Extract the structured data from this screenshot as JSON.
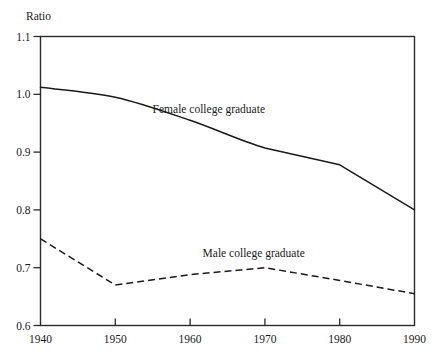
{
  "chart_data": {
    "type": "line",
    "title": "",
    "subtitle": "",
    "xlabel": "",
    "ylabel": "Ratio",
    "ylabel_position": "above-top-left",
    "x": [
      1940,
      1950,
      1960,
      1970,
      1980,
      1990
    ],
    "xlim": [
      1940,
      1990
    ],
    "ylim": [
      0.6,
      1.1
    ],
    "xticks": [
      1940,
      1950,
      1960,
      1970,
      1980,
      1990
    ],
    "xtick_labels": [
      "1940",
      "1950",
      "1960",
      "1970",
      "1980",
      "1990"
    ],
    "yticks": [
      0.6,
      0.7,
      0.8,
      0.9,
      1.0,
      1.1
    ],
    "ytick_labels": [
      "0.6",
      "0.7",
      "0.8",
      "0.9",
      "1.0",
      "1.1"
    ],
    "grid": false,
    "frame": "full-box",
    "legend_position": "inline-annotation",
    "series": [
      {
        "name": "Female college graduate",
        "style": "solid",
        "color": "#1a1a1a",
        "values": [
          1.012,
          0.995,
          0.955,
          0.907,
          0.878,
          0.8
        ],
        "label_x": 1962.5,
        "label_y": 0.968
      },
      {
        "name": "Male college graduate",
        "style": "dashed",
        "color": "#1a1a1a",
        "values": [
          0.75,
          0.67,
          0.688,
          0.7,
          0.678,
          0.655
        ],
        "label_x": 1968.5,
        "label_y": 0.718
      }
    ]
  },
  "figure": {
    "background_color": "#ffffff",
    "axis_color": "#2b2b2b"
  }
}
